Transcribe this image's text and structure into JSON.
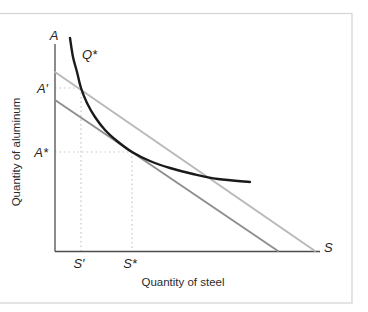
{
  "frame": {
    "background": "#ffffff",
    "border_color": "#d3d3d3"
  },
  "chart_data": {
    "type": "line",
    "title": "",
    "xlabel": "Quantity of steel",
    "ylabel": "Quantity of aluminum",
    "grid": false,
    "legend": "none",
    "axes": {
      "color": "#4d4d4d",
      "origin": [
        55,
        251.5
      ],
      "x_end": [
        320,
        251.5
      ],
      "y_end": [
        55,
        44
      ]
    },
    "end_labels": {
      "y": "A",
      "x": "S"
    },
    "curve_label": "Q*",
    "guide_color": "#c6c6c6",
    "series": [
      {
        "name": "isoquant Q*",
        "color": "#1a1a1a",
        "width": 2.4,
        "points": [
          [
            70,
            38
          ],
          [
            73,
            57
          ],
          [
            77,
            72
          ],
          [
            81,
            88
          ],
          [
            87,
            103
          ],
          [
            95,
            117
          ],
          [
            105,
            130
          ],
          [
            117,
            141
          ],
          [
            132,
            152
          ],
          [
            150,
            161
          ],
          [
            170,
            168
          ],
          [
            193,
            174
          ],
          [
            218,
            179
          ],
          [
            250,
            182
          ]
        ]
      },
      {
        "name": "outer isocost line",
        "color": "#b9b9b9",
        "width": 2,
        "points": [
          [
            55,
            72
          ],
          [
            315,
            251
          ]
        ]
      },
      {
        "name": "inner isocost line",
        "color": "#8f8f8f",
        "width": 2,
        "points": [
          [
            55,
            100
          ],
          [
            278,
            251
          ]
        ]
      }
    ],
    "guides": [
      {
        "name": "outer-line intersection",
        "y_label": "A′",
        "x_label": "S′",
        "point": [
          81,
          88
        ]
      },
      {
        "name": "tangency point",
        "y_label": "A*",
        "x_label": "S*",
        "point": [
          132,
          152
        ]
      }
    ]
  }
}
